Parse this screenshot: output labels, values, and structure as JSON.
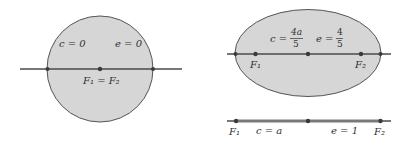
{
  "colors": {
    "fill": "#d6d6d6",
    "stroke": "#555555",
    "axis": "#4a4a4a",
    "point": "#3a3a3a",
    "text": "#333333"
  },
  "panels": [
    {
      "id": "circle",
      "shape": "circle",
      "label_c": "c = 0",
      "label_e": "e = 0",
      "focus_label": "F₁ = F₂"
    },
    {
      "id": "ellipse",
      "shape": "ellipse",
      "label_c_prefix": "c =",
      "label_c_num": "4a",
      "label_c_den": "5",
      "label_e_prefix": "e =",
      "label_e_num": "4",
      "label_e_den": "5",
      "focus1_label": "F₁",
      "focus2_label": "F₂"
    },
    {
      "id": "segment",
      "shape": "line-segment",
      "label_c": "c = a",
      "label_e": "e = 1",
      "focus1_label": "F₁",
      "focus2_label": "F₂"
    }
  ]
}
